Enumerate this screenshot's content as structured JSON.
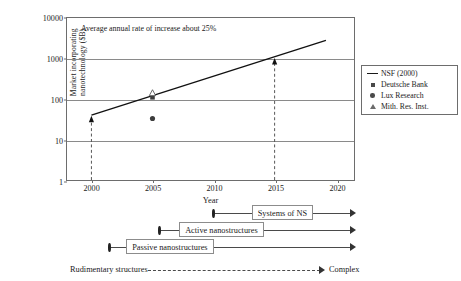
{
  "chart_data": {
    "type": "line",
    "title": "",
    "annotation": "Average annual rate of increase about 25%",
    "xlabel": "Year",
    "ylabel_line1": "Market incorporating",
    "ylabel_line2": "nanotechnology ($B)",
    "ylabel": "Market incorporating nanotechnology ($B)",
    "yscale": "log",
    "ylim": [
      1,
      10000
    ],
    "ytick_labels": [
      "1",
      "10",
      "100",
      "1000",
      "10000"
    ],
    "ytick_values": [
      1,
      10,
      100,
      1000,
      10000
    ],
    "gridlines_y": [
      10,
      100,
      1000
    ],
    "grid": true,
    "xlim": [
      1998,
      2021.5
    ],
    "xtick_labels": [
      "2000",
      "2005",
      "2010",
      "2015",
      "2020"
    ],
    "xtick_values": [
      2000,
      2005,
      2010,
      2015,
      2020
    ],
    "legend_position": "right",
    "series": [
      {
        "name": "NSF (2000)",
        "marker": "line",
        "type": "line",
        "x": [
          2000,
          2019.2
        ],
        "values": [
          40,
          2800
        ]
      },
      {
        "name": "Deutsche Bank",
        "marker": "square",
        "type": "scatter",
        "x": [
          2005
        ],
        "values": [
          110
        ]
      },
      {
        "name": "Lux Research",
        "marker": "circle",
        "type": "scatter",
        "x": [
          2005
        ],
        "values": [
          33
        ]
      },
      {
        "name": "Mith. Res. Inst.",
        "marker": "triangle",
        "type": "scatter",
        "x": [
          2005
        ],
        "values": [
          140
        ]
      }
    ],
    "endpoint_markers": [
      {
        "x": 2000,
        "value": 30,
        "marker": "triangle-up"
      },
      {
        "x": 2015,
        "value": 800,
        "marker": "triangle-up"
      }
    ],
    "dashed_verticals": [
      {
        "x": 2000,
        "from": 1,
        "to": 30
      },
      {
        "x": 2015,
        "from": 1,
        "to": 800
      }
    ]
  },
  "legend": {
    "entries": [
      {
        "label": "NSF (2000)",
        "key": "line-key-icon"
      },
      {
        "label": "Deutsche Bank",
        "key": "square-marker-icon"
      },
      {
        "label": "Lux Research",
        "key": "circle-marker-icon"
      },
      {
        "label": "Mith. Res. Inst.",
        "key": "triangle-marker-icon"
      }
    ]
  },
  "timeline": {
    "rows": [
      {
        "label": "Systems of NS",
        "start_year": 2010,
        "box_start_year": 2013.1,
        "end_year": 2021.6
      },
      {
        "label": "Active nanostructures",
        "start_year": 2005.6,
        "box_start_year": 2007.2,
        "end_year": 2021.6
      },
      {
        "label": "Passive nanostructures",
        "start_year": 2001.5,
        "box_start_year": 2002.9,
        "end_year": 2021.6
      }
    ],
    "start_label": "Rudimentary structures",
    "end_label": "Complex"
  }
}
